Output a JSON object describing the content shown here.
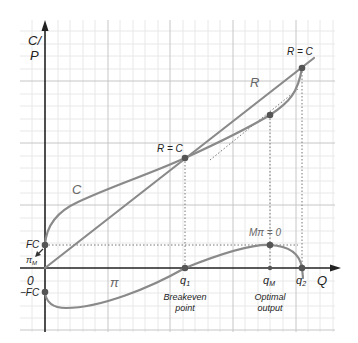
{
  "diagram": {
    "type": "cost-revenue-profit diagram",
    "axes": {
      "y_label_line1": "C/",
      "y_label_line2": "P",
      "x_label": "Q",
      "origin_label": "0"
    },
    "curve_labels": {
      "revenue": "R",
      "cost": "C",
      "profit": "π"
    },
    "point_labels": {
      "breakeven_low": "R = C",
      "breakeven_high": "R = C",
      "max_profit": "Mπ = 0",
      "fixed_cost": "FC",
      "neg_fixed_cost": "−FC",
      "pi_max": "π",
      "pi_max_sub": "M"
    },
    "x_ticks": {
      "q1": "q",
      "q1_sub": "1",
      "qM": "q",
      "qM_sub": "M",
      "q2": "q",
      "q2_sub": "2"
    },
    "annotations": {
      "breakeven_line1": "Breakeven",
      "breakeven_line2": "point",
      "optimal_line1": "Optimal",
      "optimal_line2": "output"
    },
    "colors": {
      "axis": "#222222",
      "curve": "#8a8a8a",
      "point": "#555555",
      "grid_major": "#c8c8c8",
      "grid_minor": "#e6e6e6",
      "dotted": "#777777"
    }
  }
}
